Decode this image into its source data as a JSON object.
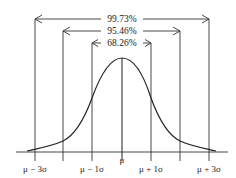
{
  "diagram": {
    "intervals": [
      {
        "label": "99.73%",
        "from": "μ − 3σ",
        "to": "μ + 3σ"
      },
      {
        "label": "95.46%",
        "from": "μ − 2σ",
        "to": "μ + 2σ"
      },
      {
        "label": "68.26%",
        "from": "μ − 1σ",
        "to": "μ + 1σ"
      }
    ],
    "axis_labels": {
      "minus3": "μ − 3σ",
      "minus1": "μ − 1σ",
      "mean": "μ",
      "plus1": "μ + 1σ",
      "plus3": "μ + 3σ"
    },
    "colors": {
      "line": "#333333",
      "background": "#ffffff"
    }
  }
}
